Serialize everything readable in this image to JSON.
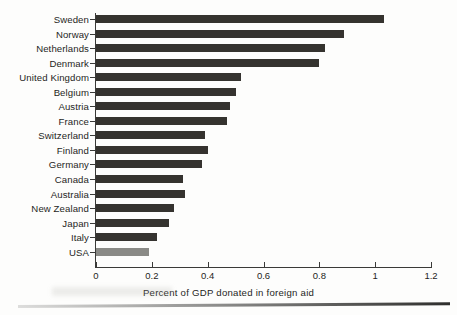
{
  "chart_data": {
    "type": "bar",
    "orientation": "horizontal",
    "title": "",
    "xlabel": "Percent of GDP donated in foreign aid",
    "ylabel": "",
    "xlim": [
      0,
      1.2
    ],
    "xticks": [
      "0",
      "0.2",
      "0.4",
      "0.6",
      "0.8",
      "1",
      "1.2"
    ],
    "xtick_values": [
      0,
      0.2,
      0.4,
      0.6,
      0.8,
      1,
      1.2
    ],
    "grid": false,
    "legend": false,
    "categories": [
      "Sweden",
      "Norway",
      "Netherlands",
      "Denmark",
      "United Kingdom",
      "Belgium",
      "Austria",
      "France",
      "Switzerland",
      "Finland",
      "Germany",
      "Canada",
      "Australia",
      "New Zealand",
      "Japan",
      "Italy",
      "USA"
    ],
    "values": [
      1.03,
      0.89,
      0.82,
      0.8,
      0.52,
      0.5,
      0.48,
      0.47,
      0.39,
      0.4,
      0.38,
      0.31,
      0.32,
      0.28,
      0.26,
      0.22,
      0.19
    ],
    "bar_color": "#35332f",
    "highlight_category": "USA",
    "highlight_color": "#8a8a86"
  }
}
